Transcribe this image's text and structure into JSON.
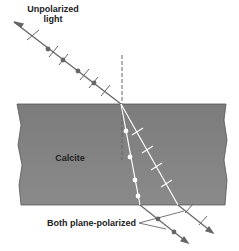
{
  "diagram": {
    "labels": {
      "incident": "Unpolarized light",
      "incident_line1": "Unpolarized",
      "incident_line2": "light",
      "material": "Calcite",
      "output": "Both plane-polarized"
    },
    "colors": {
      "slab": "#7a7a7a",
      "ray_outside": "#555555",
      "ray_inside": "#ffffff",
      "text": "#222222"
    }
  }
}
